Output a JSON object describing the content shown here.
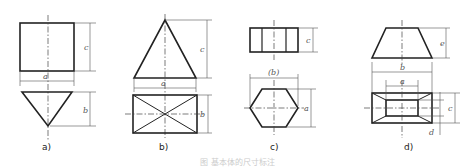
{
  "figure": {
    "caption": "图 基本体的尺寸标注",
    "panels": [
      {
        "id": "a",
        "label": "a)",
        "description": "Square-based pyramid (inverted cone-like): front view square, top view triangle",
        "dims": {
          "width": "a",
          "height": "c",
          "depth": "b"
        }
      },
      {
        "id": "b",
        "label": "b)",
        "description": "Rectangular pyramid: front view triangle, top view rectangle with diagonals",
        "dims": {
          "width": "a",
          "height": "c",
          "depth": "b"
        }
      },
      {
        "id": "c",
        "label": "c)",
        "description": "Hexagonal prism: front view rectangle with edges, top view hexagon",
        "dims": {
          "height": "c",
          "across_corners": "(b)",
          "across_flats": "a"
        }
      },
      {
        "id": "d",
        "label": "d)",
        "description": "Truncated rectangular pyramid (frustum): front view trapezoid, top view nested rectangles",
        "dims": {
          "height": "e",
          "bottom_width": "b",
          "top_width": "a",
          "bottom_depth": "c",
          "top_depth": "d"
        }
      }
    ]
  },
  "dim_labels": {
    "a_c": "c",
    "a_a": "a",
    "a_b": "b",
    "b_c": "c",
    "b_a": "a",
    "b_b": "b",
    "c_c": "c",
    "c_b": "(b)",
    "c_a": "a",
    "d_e": "e",
    "d_b": "b",
    "d_a": "a",
    "d_c": "c",
    "d_d": "d"
  }
}
